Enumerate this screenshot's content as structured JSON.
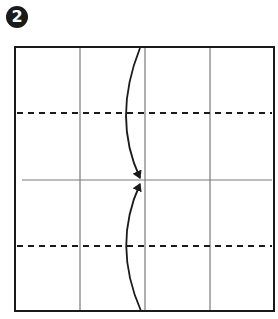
{
  "step": {
    "number": "2"
  },
  "diagram": {
    "type": "origami-fold-step",
    "square": {
      "x": 15,
      "y": 47,
      "width": 259,
      "height": 264,
      "border_color": "#1a1a1a"
    },
    "vertical_creases_x": [
      80,
      145,
      210
    ],
    "center_crease_y": 180,
    "dashed_fold_lines_y": [
      113,
      246
    ],
    "arrows": [
      {
        "name": "top-fold-arrow",
        "from": [
          140,
          48
        ],
        "via": [
          120,
          118
        ],
        "to": [
          141,
          180
        ],
        "direction": "down"
      },
      {
        "name": "bottom-fold-arrow",
        "from": [
          141,
          311
        ],
        "via": [
          120,
          245
        ],
        "to": [
          141,
          182
        ],
        "direction": "up"
      }
    ],
    "colors": {
      "line": "#1a1a1a",
      "crease": "#7a7a7a",
      "background": "#ffffff"
    }
  }
}
